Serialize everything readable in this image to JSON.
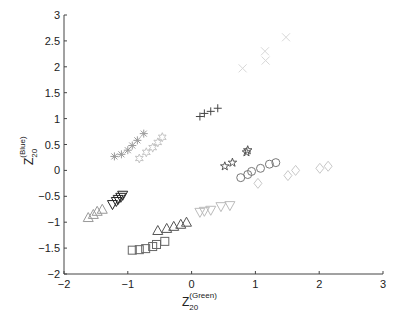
{
  "chart_data": {
    "type": "scatter",
    "title": "",
    "xlabel": "Z_20^(Green)",
    "ylabel": "Z_20^(Blue)",
    "xlabel_main": "Z",
    "xlabel_sub": "20",
    "xlabel_sup": "(Green)",
    "ylabel_main": "Z",
    "ylabel_sub": "20",
    "ylabel_sup": "(Blue)",
    "xlim": [
      -2,
      3
    ],
    "ylim": [
      -2,
      3
    ],
    "xticks": [
      -2,
      -1,
      0,
      1,
      2,
      3
    ],
    "yticks": [
      -2,
      -1.5,
      -1,
      -0.5,
      0,
      0.5,
      1,
      1.5,
      2,
      2.5,
      3
    ],
    "xtick_labels": [
      "−2",
      "−1",
      "0",
      "1",
      "2",
      "3"
    ],
    "ytick_labels": [
      "−2",
      "−1.5",
      "−1",
      "−0.5",
      "0",
      "0.5",
      "1",
      "1.5",
      "2",
      "2.5",
      "3"
    ],
    "grid": false,
    "legend": null,
    "series": [
      {
        "name": "x-light",
        "marker": "x",
        "color": "#d8d8d8",
        "x": [
          0.8,
          1.15,
          1.16,
          1.48
        ],
        "y": [
          1.97,
          2.3,
          2.12,
          2.57
        ]
      },
      {
        "name": "plus-dark",
        "marker": "plus",
        "color": "#444444",
        "x": [
          0.13,
          0.2,
          0.3,
          0.41
        ],
        "y": [
          1.04,
          1.1,
          1.14,
          1.2
        ]
      },
      {
        "name": "asterisk-gray",
        "marker": "asterisk",
        "color": "#9a9a9a",
        "x": [
          -1.21,
          -1.1,
          -1.0,
          -0.93,
          -0.85,
          -0.75
        ],
        "y": [
          0.27,
          0.31,
          0.39,
          0.48,
          0.58,
          0.71
        ]
      },
      {
        "name": "hexagram-light",
        "marker": "hexagram",
        "color": "#c4c4c4",
        "x": [
          -0.82,
          -0.71,
          -0.61,
          -0.53,
          -0.46
        ],
        "y": [
          0.23,
          0.35,
          0.44,
          0.54,
          0.64
        ]
      },
      {
        "name": "star-dark",
        "marker": "star",
        "color": "#555555",
        "x": [
          0.52,
          0.64,
          0.86,
          0.88
        ],
        "y": [
          0.08,
          0.15,
          0.35,
          0.39
        ]
      },
      {
        "name": "circle-gray",
        "marker": "circle",
        "color": "#777777",
        "x": [
          0.77,
          0.88,
          0.94,
          1.08,
          1.22,
          1.32
        ],
        "y": [
          -0.14,
          -0.08,
          -0.02,
          0.04,
          0.12,
          0.15
        ]
      },
      {
        "name": "diamond-light",
        "marker": "diamond",
        "color": "#c8c8c8",
        "x": [
          1.04,
          1.51,
          1.63,
          2.01,
          2.14
        ],
        "y": [
          -0.25,
          -0.1,
          0.0,
          0.04,
          0.08
        ]
      },
      {
        "name": "triangle-down-dark",
        "marker": "triangle-down",
        "color": "#222222",
        "x": [
          -1.24,
          -1.18,
          -1.15,
          -1.11,
          -1.08
        ],
        "y": [
          -0.66,
          -0.6,
          -0.56,
          -0.52,
          -0.48
        ]
      },
      {
        "name": "triangle-up-gray",
        "marker": "triangle-up",
        "color": "#999999",
        "x": [
          -1.62,
          -1.54,
          -1.48,
          -1.4
        ],
        "y": [
          -0.91,
          -0.85,
          -0.79,
          -0.75
        ]
      },
      {
        "name": "triangle-down-light",
        "marker": "triangle-down",
        "color": "#bbbbbb",
        "x": [
          0.13,
          0.2,
          0.3,
          0.46,
          0.6
        ],
        "y": [
          -0.81,
          -0.79,
          -0.77,
          -0.7,
          -0.68
        ]
      },
      {
        "name": "triangle-up-dark",
        "marker": "triangle-up",
        "color": "#555555",
        "x": [
          -0.53,
          -0.39,
          -0.28,
          -0.17,
          -0.08
        ],
        "y": [
          -1.16,
          -1.12,
          -1.08,
          -1.04,
          -1.0
        ]
      },
      {
        "name": "square-gray",
        "marker": "square",
        "color": "#666666",
        "x": [
          -0.93,
          -0.82,
          -0.72,
          -0.61,
          -0.55,
          -0.42
        ],
        "y": [
          -1.54,
          -1.53,
          -1.51,
          -1.47,
          -1.43,
          -1.37
        ]
      }
    ],
    "layout": {
      "plot_left": 64,
      "plot_right": 383,
      "plot_top": 15,
      "plot_bottom": 274,
      "axis_color": "#444444"
    }
  }
}
